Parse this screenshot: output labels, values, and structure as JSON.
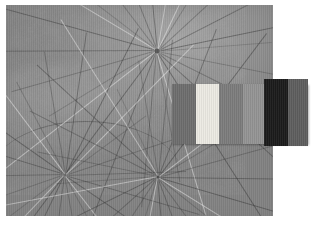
{
  "document": {
    "title": "Leaf scan with grayscale calibration strip",
    "background_color": "#ffffff",
    "width": 316,
    "height": 236
  },
  "photo": {
    "name": "leaf-scan",
    "subject": "water lily / lotus leaves with radiating veins",
    "rendering": "grayscale",
    "frame": {
      "left": 6,
      "top": 5,
      "width": 267,
      "height": 211
    },
    "base_color": "#8d8d8d",
    "highlight_color": "#a3a3a3",
    "shadow_color": "#7e7e7e",
    "vein_color": "#303030",
    "vein_highlight_color": "#ececec",
    "scan_striping": "vertical",
    "vein_hubs": [
      {
        "name": "upper-right-hub",
        "x_pct": 56.5,
        "y_pct": 22.0,
        "rays": 26,
        "radius_pct": 78,
        "dot_size": 5,
        "dot_color": "#5a5a5a"
      },
      {
        "name": "lower-left-hub",
        "x_pct": 22.0,
        "y_pct": 80.5,
        "rays": 22,
        "radius_pct": 62,
        "dot_size": 3,
        "dot_color": "#6a6a6a"
      },
      {
        "name": "lower-center-hub",
        "x_pct": 57.0,
        "y_pct": 81.5,
        "rays": 26,
        "radius_pct": 66,
        "dot_size": 3,
        "dot_color": "#4e4e4e"
      }
    ]
  },
  "calibration_strip": {
    "name": "grayscale-calibration-strip",
    "frame": {
      "left": 172,
      "top": 84,
      "width": 136,
      "height": 60
    },
    "patch_count": 6,
    "patches": [
      {
        "name": "patch-dark-gray",
        "label": "dark gray",
        "color": "#6e6e6e",
        "width_px": 24,
        "tall": false
      },
      {
        "name": "patch-white",
        "label": "white",
        "color": "#eceae3",
        "width_px": 23,
        "tall": false
      },
      {
        "name": "patch-mid-gray",
        "label": "mid gray",
        "color": "#7c7c7c",
        "width_px": 24,
        "tall": false
      },
      {
        "name": "patch-light-gray",
        "label": "light gray",
        "color": "#949494",
        "width_px": 21,
        "tall": false
      },
      {
        "name": "patch-black",
        "label": "black",
        "color": "#1b1b1b",
        "width_px": 24,
        "tall": true
      },
      {
        "name": "patch-charcoal",
        "label": "charcoal",
        "color": "#5e5e5e",
        "width_px": 20,
        "tall": true
      }
    ]
  }
}
